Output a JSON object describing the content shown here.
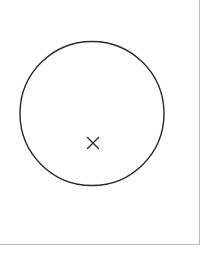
{
  "diagram": {
    "frame": {
      "width": 199,
      "height": 244,
      "border_color": "#b8b8b8"
    },
    "circle": {
      "cx": 92,
      "cy": 113.5,
      "r": 72,
      "stroke": "#2a2a2a",
      "stroke_width": 1.4
    },
    "marker": {
      "type": "cross",
      "cx": 93,
      "cy": 143,
      "half_size": 5.5,
      "stroke": "#2a2a2a",
      "stroke_width": 1.4
    }
  }
}
